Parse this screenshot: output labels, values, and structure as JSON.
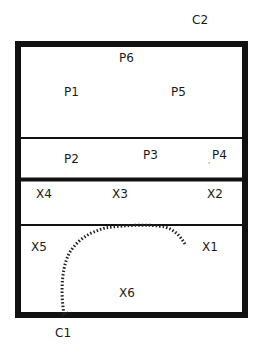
{
  "diagram": {
    "outside_labels": {
      "top_right": "C2",
      "bottom_left": "C1"
    },
    "sections": [
      {
        "name": "upper-panel",
        "labels": [
          "P6",
          "P1",
          "P5"
        ]
      },
      {
        "name": "middle-strip",
        "labels": [
          "P2",
          "P3",
          "P4"
        ]
      },
      {
        "name": "lower-strip",
        "labels": [
          "X4",
          "X3",
          "X2"
        ]
      },
      {
        "name": "bottom-panel",
        "labels": [
          "X5",
          "X1",
          "X6"
        ]
      }
    ],
    "colors": {
      "line": "#111111",
      "hatch": "#222222",
      "background": "#ffffff"
    }
  }
}
